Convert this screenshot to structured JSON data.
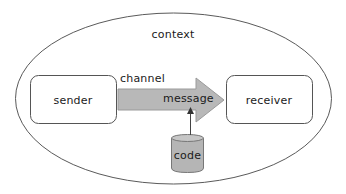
{
  "diagram": {
    "context": {
      "label": "context",
      "shape": "ellipse",
      "stroke": "#555555",
      "fill": "#ffffff"
    },
    "nodes": {
      "sender": {
        "label": "sender",
        "shape": "rounded-rectangle"
      },
      "receiver": {
        "label": "receiver",
        "shape": "rounded-rectangle"
      },
      "code": {
        "label": "code",
        "shape": "cylinder",
        "fill": "#b5b5b5"
      }
    },
    "channel": {
      "label": "channel",
      "message_label": "message",
      "shape": "block-arrow",
      "fill": "#b8b8b8",
      "stroke": "#8a8a8a",
      "from": "sender",
      "to": "receiver"
    },
    "edges": [
      {
        "from": "code",
        "to": "message",
        "style": "arrow"
      }
    ],
    "colors": {
      "outline": "#555555",
      "arrow_fill": "#b8b8b8",
      "cylinder_fill": "#b5b5b5",
      "text": "#1a1a1a"
    }
  }
}
